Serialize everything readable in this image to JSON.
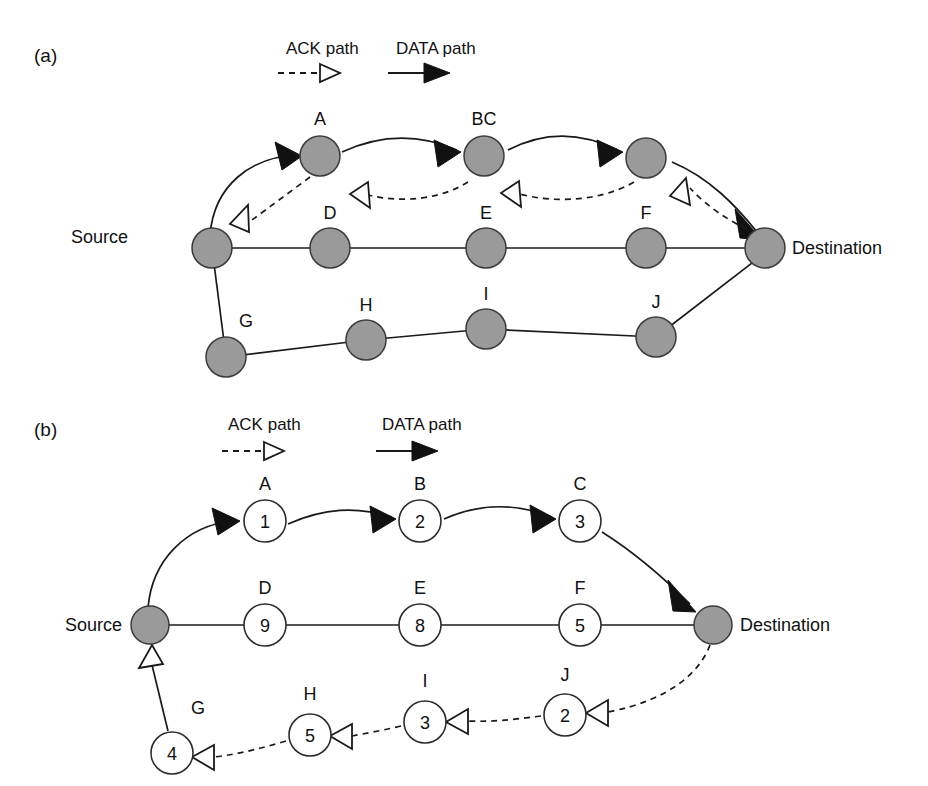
{
  "figure": {
    "background_color": "#ffffff",
    "line_color": "#1a1a1a",
    "filled_node_color": "#9a9a9a",
    "open_node_color": "#ffffff"
  },
  "panels": [
    {
      "id": "a",
      "label": "(a)",
      "legend": {
        "ack": {
          "label": "ACK path",
          "style": "dashed",
          "arrow": "hollow"
        },
        "data": {
          "label": "DATA path",
          "style": "solid",
          "arrow": "filled"
        }
      },
      "endpoints": {
        "source": "Source",
        "destination": "Destination"
      },
      "nodes": [
        {
          "id": "a-top-1",
          "label": "A",
          "value": "",
          "style": "filled"
        },
        {
          "id": "a-top-2",
          "label": "BC",
          "value": "",
          "style": "filled"
        },
        {
          "id": "a-top-3",
          "label": "",
          "value": "",
          "style": "filled"
        },
        {
          "id": "a-mid-1",
          "label": "D",
          "value": "",
          "style": "filled"
        },
        {
          "id": "a-mid-2",
          "label": "E",
          "value": "",
          "style": "filled"
        },
        {
          "id": "a-mid-3",
          "label": "F",
          "value": "",
          "style": "filled"
        },
        {
          "id": "a-bot-1",
          "label": "G",
          "value": "",
          "style": "filled"
        },
        {
          "id": "a-bot-2",
          "label": "H",
          "value": "",
          "style": "filled"
        },
        {
          "id": "a-bot-3",
          "label": "I",
          "value": "",
          "style": "filled"
        },
        {
          "id": "a-bot-4",
          "label": "J",
          "value": "",
          "style": "filled"
        }
      ]
    },
    {
      "id": "b",
      "label": "(b)",
      "legend": {
        "ack": {
          "label": "ACK path",
          "style": "dashed",
          "arrow": "hollow"
        },
        "data": {
          "label": "DATA path",
          "style": "solid",
          "arrow": "filled"
        }
      },
      "endpoints": {
        "source": "Source",
        "destination": "Destination"
      },
      "nodes": [
        {
          "id": "b-top-1",
          "label": "A",
          "value": "1",
          "style": "open"
        },
        {
          "id": "b-top-2",
          "label": "B",
          "value": "2",
          "style": "open"
        },
        {
          "id": "b-top-3",
          "label": "C",
          "value": "3",
          "style": "open"
        },
        {
          "id": "b-mid-1",
          "label": "D",
          "value": "9",
          "style": "open"
        },
        {
          "id": "b-mid-2",
          "label": "E",
          "value": "8",
          "style": "open"
        },
        {
          "id": "b-mid-3",
          "label": "F",
          "value": "5",
          "style": "open"
        },
        {
          "id": "b-bot-1",
          "label": "G",
          "value": "4",
          "style": "open"
        },
        {
          "id": "b-bot-2",
          "label": "H",
          "value": "5",
          "style": "open"
        },
        {
          "id": "b-bot-3",
          "label": "I",
          "value": "3",
          "style": "open"
        },
        {
          "id": "b-bot-4",
          "label": "J",
          "value": "2",
          "style": "open"
        }
      ]
    }
  ]
}
